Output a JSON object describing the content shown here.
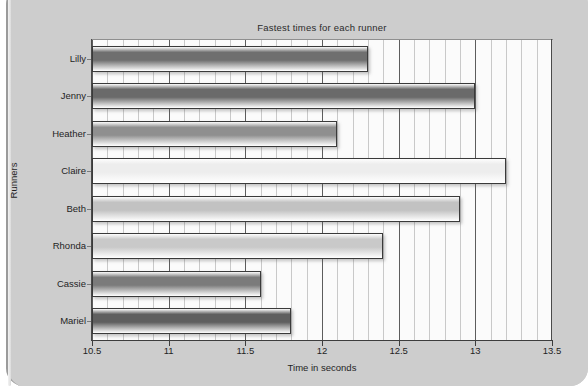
{
  "chart_data": {
    "type": "bar",
    "orientation": "horizontal",
    "title": "Fastest times for each runner",
    "xlabel": "Time in seconds",
    "ylabel": "Runners",
    "categories": [
      "Lilly",
      "Jenny",
      "Heather",
      "Claire",
      "Beth",
      "Rhonda",
      "Cassie",
      "Mariel"
    ],
    "values": [
      12.3,
      13.0,
      12.1,
      13.2,
      12.9,
      12.4,
      11.6,
      11.8
    ],
    "xlim": [
      10.5,
      13.5
    ],
    "xticks": [
      "10.5",
      "11",
      "11.5",
      "12",
      "12.5",
      "13",
      "13.5"
    ],
    "xtick_values": [
      10.5,
      11,
      11.5,
      12,
      12.5,
      13,
      13.5
    ],
    "minor_tick_step": 0.1,
    "grid": "vertical",
    "legend": "none",
    "bar_colors": [
      "#6f6f6f",
      "#6a6a6a",
      "#8f8f8f",
      "#ededed",
      "#c2c2c2",
      "#c9c9c9",
      "#7b7b7b",
      "#5f5f5f"
    ],
    "bar_border_color": "#3a3a3a",
    "plot_background": "#fbfbfb",
    "page_background": "#cdcdcd"
  }
}
